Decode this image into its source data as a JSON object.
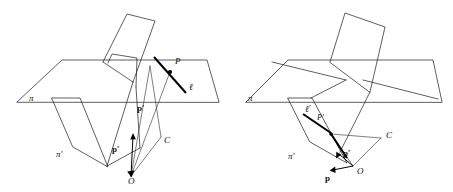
{
  "figure": {
    "background_color": "#ffffff",
    "line_color": "#1a1a1a",
    "emphasis_color": "#000000",
    "panels": [
      {
        "id": "left-panel",
        "name": "left-diagram",
        "labels": [
          {
            "name": "plane-pi-label",
            "text": "π",
            "x": 29,
            "y": 97,
            "style": "greek"
          },
          {
            "name": "plane-pi-prime-label",
            "text": "π′",
            "x": 57,
            "y": 155,
            "style": "greek"
          },
          {
            "name": "point-P-label",
            "text": "P",
            "x": 175,
            "y": 61,
            "style": "italic"
          },
          {
            "name": "line-ell-label",
            "text": "ℓ",
            "x": 189,
            "y": 86,
            "style": "script"
          },
          {
            "name": "vector-p-prime-upper-label",
            "text": "p′",
            "x": 138,
            "y": 108,
            "style": "bold"
          },
          {
            "name": "vector-p-prime-lower-label",
            "text": "p′",
            "x": 113,
            "y": 148,
            "style": "bold"
          },
          {
            "name": "point-C-label",
            "text": "C",
            "x": 164,
            "y": 139,
            "style": "italic"
          },
          {
            "name": "point-O-label",
            "text": "O",
            "x": 128,
            "y": 176,
            "style": "italic"
          }
        ]
      },
      {
        "id": "right-panel",
        "name": "right-diagram",
        "labels": [
          {
            "name": "plane-pi-label",
            "text": "π",
            "x": 250,
            "y": 97,
            "style": "greek"
          },
          {
            "name": "plane-pi-prime-label",
            "text": "π′",
            "x": 288,
            "y": 157,
            "style": "greek"
          },
          {
            "name": "line-ell-prime-label",
            "text": "ℓ′",
            "x": 305,
            "y": 109,
            "style": "script"
          },
          {
            "name": "point-P-prime-label",
            "text": "P′",
            "x": 317,
            "y": 118,
            "style": "italic"
          },
          {
            "name": "vector-p-prime-label",
            "text": "p′",
            "x": 342,
            "y": 153,
            "style": "bold"
          },
          {
            "name": "vector-p-label",
            "text": "p",
            "x": 325,
            "y": 178,
            "style": "bold"
          },
          {
            "name": "point-C-label",
            "text": "C",
            "x": 387,
            "y": 135,
            "style": "italic"
          },
          {
            "name": "point-O-label",
            "text": "O",
            "x": 358,
            "y": 168,
            "style": "italic"
          }
        ]
      }
    ],
    "geometry": {
      "left": {
        "plane_pi_outline": "M 16,103 L 62,60 L 208,60 L 218,103 Z",
        "plane_pi_horizon": "M 16,103 L 218,103",
        "plane_pi_upper_edge": "M 62,60 L 208,60",
        "vertical_sheet_a": "M 105,61 L 128,14 L 156,21 L 134,81 Z",
        "vertical_sheet_b": "M 109,63 L 112,56 L 138,57 L 137,86 Z",
        "plane_pi_prime_outline": "M 50,99 L 78,99 L 111,171 L 75,148 Z",
        "plane_pi_prime_inner": "M 75,99 L 104,99 L 111,171 Z",
        "ray_to_P": "M 131,175 L 173,70",
        "ray_C_edge": "M 131,175 L 160,137",
        "line_ell": "M 153,56 L 185,92",
        "point_P": {
          "cx": 170,
          "cy": 72,
          "r": 2.0
        },
        "vector_p_prime_up": {
          "x1": 131,
          "y1": 175,
          "x2": 133,
          "y2": 137
        },
        "cone_edges": [
          "M 131,175 L 150,65",
          "M 131,175 L 160,137",
          "M 150,65 L 160,137"
        ]
      },
      "right": {
        "plane_pi_outline": "M 250,103 L 290,60 L 435,60 L 443,103 Z",
        "plane_pi_horizon": "M 250,103 L 443,103",
        "vertical_sheet": "M 330,62 L 346,14 L 384,27 L 370,92 Z",
        "plane_pi_prime_outline": "M 287,99 L 311,99 L 345,162 L 310,143 Z",
        "line_ell_prime": "M 303,114 L 330,133",
        "point_P_prime": {
          "cx": 331,
          "cy": 134,
          "r": 1.6
        },
        "ray_C": "M 331,134 L 380,139",
        "ray_O": "M 331,134 L 352,165",
        "cone_C_O": "M 380,139 L 352,165",
        "vector_p_prime": {
          "x1": 352,
          "y1": 165,
          "x2": 336,
          "y2": 152
        },
        "vector_p": {
          "x1": 352,
          "y1": 165,
          "x2": 329,
          "y2": 170
        }
      }
    }
  }
}
